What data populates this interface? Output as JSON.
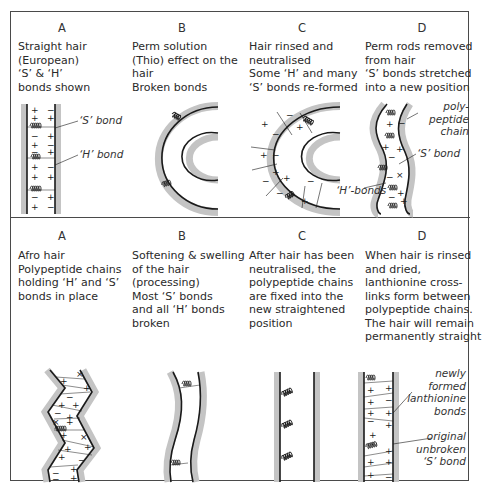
{
  "top_row": {
    "panels": [
      {
        "label": "A",
        "caption": "Straight hair\n(European)\n‘S’ & ‘H’\nbonds shown"
      },
      {
        "label": "B",
        "caption": "Perm solution\n(Thio) effect on the\nhair\nBroken bonds"
      },
      {
        "label": "C",
        "caption": "Hair rinsed and\nneutralised\nSome ‘H’ and many\n‘S’ bonds re-formed"
      },
      {
        "label": "D",
        "caption": "Perm rods removed\nfrom hair\n‘S’ bonds stretched\ninto a new position"
      }
    ],
    "annotations": {
      "s_bond_a": "‘S’ bond",
      "h_bond_a": "‘H’ bond",
      "polypeptide_chain": "poly-peptide\nchain",
      "s_bond_d": "‘S’ bond",
      "h_bonds_d": "‘H’-bonds"
    }
  },
  "bottom_row": {
    "panels": [
      {
        "label": "A",
        "caption": "Afro hair\nPolypeptide chains\nholding ‘H’ and ‘S’\nbonds in place"
      },
      {
        "label": "B",
        "caption": "Softening & swelling\nof the hair\n(processing)\nMost ‘S’ bonds\nand all ‘H’ bonds\nbroken"
      },
      {
        "label": "C",
        "caption": "After hair has been\nneutralised, the\npolypeptide chains\nare fixed into the\nnew straightened\nposition"
      },
      {
        "label": "D",
        "caption": "When hair is rinsed\nand dried,\nlanthionine cross-\nlinks form between\npolypeptide chains.\nThe hair will remain\npermanently straight"
      }
    ],
    "annotations": {
      "lanthionine": "newly formed\nlanthionine\nbonds",
      "original_s_bond": "original\nunbroken\n‘S’ bond"
    }
  },
  "colors": {
    "line": "#1a1a1a",
    "shadow": "#c4c4c4",
    "frame": "#4a4a4a"
  }
}
